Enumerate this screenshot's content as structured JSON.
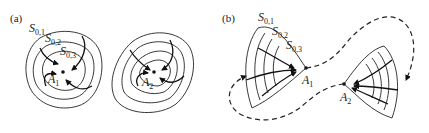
{
  "figure": {
    "panels": [
      {
        "id": "a",
        "label": "(a)",
        "surface_labels": [
          {
            "base": "S",
            "sub": "0,1"
          },
          {
            "base": "S",
            "sub": "0,2"
          },
          {
            "base": "S",
            "sub": "0,3"
          }
        ],
        "attractors": [
          {
            "base": "A",
            "sub": "1"
          },
          {
            "base": "A",
            "sub": "2"
          }
        ]
      },
      {
        "id": "b",
        "label": "(b)",
        "surface_labels": [
          {
            "base": "S",
            "sub": "0,1"
          },
          {
            "base": "S",
            "sub": "0,2"
          },
          {
            "base": "S",
            "sub": "0,3"
          }
        ],
        "attractors": [
          {
            "base": "A",
            "sub": "1"
          },
          {
            "base": "A",
            "sub": "2"
          }
        ]
      }
    ],
    "colors": {
      "ink": "#222222",
      "background": "#ffffff"
    }
  }
}
